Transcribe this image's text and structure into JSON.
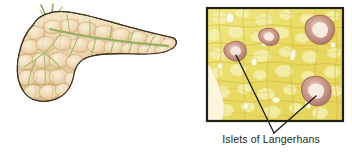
{
  "figure": {
    "width": 352,
    "height": 152,
    "background_color": "#ffffff",
    "panels": [
      {
        "id": "pancreas-illustration",
        "type": "anatomical-illustration",
        "subject": "pancreas",
        "description": "Whole pancreas gross anatomy, head at lower left, body and tail extending to upper right",
        "structures": [
          {
            "name": "pancreas-body",
            "label": "",
            "fill_color": "#ecd8b4",
            "outline_color": "#4d3a26"
          },
          {
            "name": "pancreatic-duct",
            "label": "",
            "stroke_color": "#9aab63"
          },
          {
            "name": "lobule-texture",
            "label": "",
            "fill_color": "#e0b87e"
          }
        ]
      },
      {
        "id": "histology-micrograph",
        "type": "micrograph",
        "subject": "pancreas tissue section",
        "frame_color": "#241d14",
        "tissue_color": "#e9dd6b",
        "islet_color": "#c0897c",
        "acinar_color": "#f2ea9e",
        "callout_line_color": "#1a1a1a",
        "callout_count": 2,
        "caption": "Islets of Langerhans",
        "islets": [
          {
            "name": "islet-upper-left",
            "cx": 46,
            "cy": 50
          },
          {
            "name": "islet-upper-center",
            "cx": 80,
            "cy": 35
          },
          {
            "name": "islet-upper-right",
            "cx": 132,
            "cy": 25
          },
          {
            "name": "islet-lower-right",
            "cx": 128,
            "cy": 88
          }
        ]
      }
    ]
  },
  "labels": {
    "islets_of_langerhans": "Islets of Langerhans"
  },
  "colors": {
    "page_background": "#ffffff",
    "text": "#231f20",
    "frame": "#241d14",
    "tissue_yellow": "#e9dd6b",
    "islet_pink": "#c0897c",
    "pancreas_tan": "#ecd8b4",
    "pancreas_outline": "#4d3a26",
    "duct_green": "#9aab63"
  }
}
